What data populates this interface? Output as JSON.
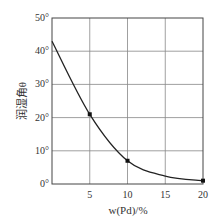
{
  "chart_data": {
    "type": "line",
    "title": "",
    "xlabel": "w(Pd)/%",
    "ylabel": "润湿角θ",
    "x": [
      0,
      5,
      10,
      15,
      20
    ],
    "series": [
      {
        "name": "wetting angle",
        "values": [
          43,
          21,
          7,
          2.4,
          1
        ],
        "markers_at": [
          5,
          10,
          20
        ]
      }
    ],
    "xlim": [
      0,
      20
    ],
    "ylim": [
      0,
      50
    ],
    "x_ticks": [
      "5",
      "10",
      "15",
      "20"
    ],
    "y_ticks": [
      "0°",
      "10°",
      "20°",
      "30°",
      "40°",
      "50°"
    ],
    "grid": true,
    "legend": "none"
  },
  "labels": {
    "xlabel": "w(Pd)/%",
    "ylabel": "润湿角θ"
  }
}
